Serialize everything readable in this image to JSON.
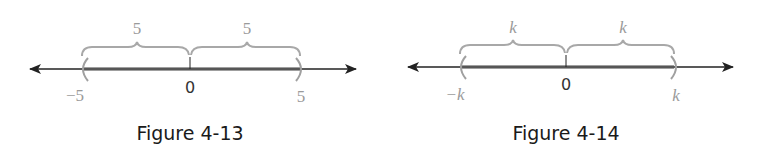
{
  "figures": [
    {
      "caption": "Figure 4-13",
      "left_label": "−5",
      "center_label": "0",
      "right_label": "5",
      "left_brace_label": "5",
      "right_brace_label": "5",
      "interval": "open (-5, 5)"
    },
    {
      "caption": "Figure 4-14",
      "left_label": "−k",
      "center_label": "0",
      "right_label": "k",
      "left_brace_label": "k",
      "right_brace_label": "k",
      "interval": "open (-k, k)"
    }
  ],
  "colors": {
    "axis": "#222222",
    "highlight": "#555555",
    "labels": "#9a9a9a",
    "brace": "#a8a8a8"
  }
}
